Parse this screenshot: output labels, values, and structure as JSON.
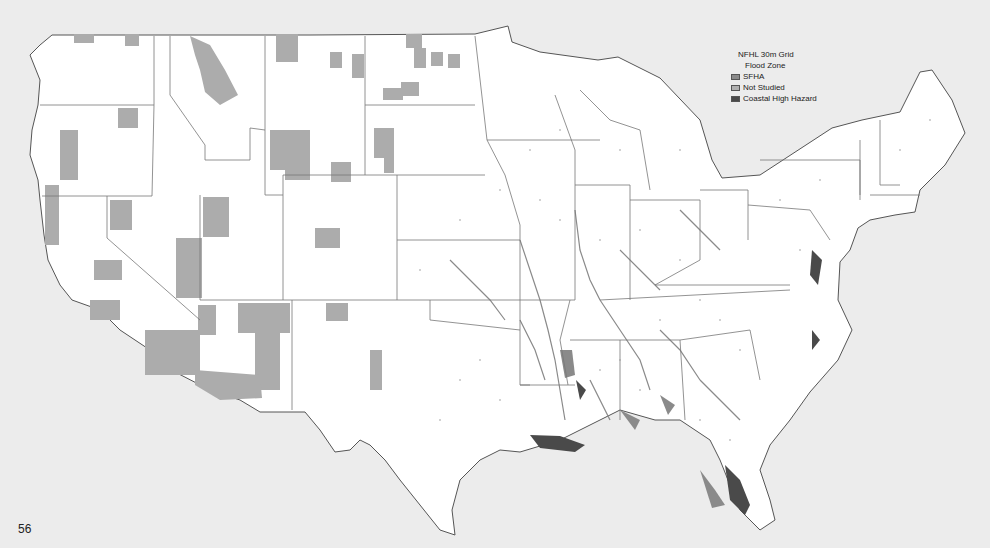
{
  "slide": {
    "page_number": "56"
  },
  "map": {
    "subject": "Contiguous United States NFHL flood zone map",
    "colors": {
      "background": "#ececec",
      "land": "#ffffff",
      "state_border": "#777777",
      "coast_border": "#555555",
      "not_studied": "#a9a9a9",
      "sfha": "#8a8a8a",
      "coastal_high_hazard": "#4a4a4a"
    }
  },
  "legend": {
    "title": "NFHL 30m Grid",
    "subtitle": "Flood Zone",
    "items": [
      {
        "label": "SFHA",
        "color": "#8a8a8a"
      },
      {
        "label": "Not Studied",
        "color": "#b0b0b0"
      },
      {
        "label": "Coastal High Hazard",
        "color": "#4a4a4a"
      }
    ]
  }
}
